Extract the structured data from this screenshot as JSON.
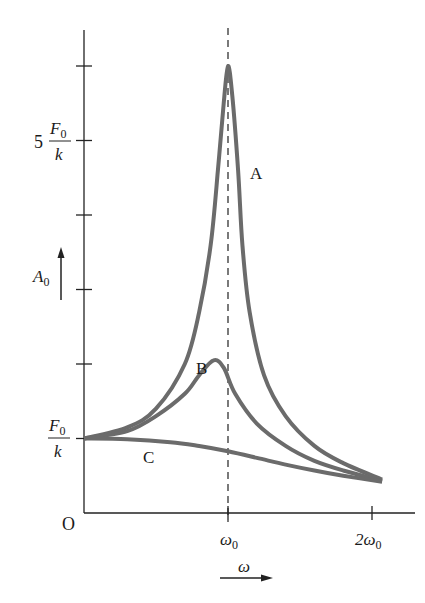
{
  "chart_data": {
    "type": "line",
    "title": "",
    "xlabel": "ω",
    "ylabel": "A0",
    "x_unit": "ω0",
    "y_unit": "F0/k",
    "xlim": [
      0,
      2.25
    ],
    "ylim": [
      0,
      6.4
    ],
    "grid": false,
    "legend": "inline labels",
    "x_ticks": [
      {
        "value": 1,
        "label": "ω0",
        "label_main": "ω",
        "label_sub": "0"
      },
      {
        "value": 2,
        "label": "2ω0",
        "label_main": "2ω",
        "label_sub": "0"
      }
    ],
    "y_ticks": [
      {
        "value": 1,
        "label": "F0/k"
      },
      {
        "value": 2,
        "label": ""
      },
      {
        "value": 3,
        "label": ""
      },
      {
        "value": 4,
        "label": ""
      },
      {
        "value": 5,
        "label": "5 F0/k"
      },
      {
        "value": 6,
        "label": ""
      }
    ],
    "origin_label": "O",
    "reference_line": {
      "x": 1,
      "style": "dashed",
      "label": "ω = ω0"
    },
    "series": [
      {
        "name": "A",
        "x": [
          0,
          0.3,
          0.5,
          0.7,
          0.8,
          0.88,
          0.93,
          0.97,
          1.0,
          1.03,
          1.07,
          1.1,
          1.15,
          1.25,
          1.4,
          1.6,
          1.8,
          2.07
        ],
        "y": [
          1,
          1.15,
          1.4,
          2.0,
          2.7,
          3.6,
          4.6,
          5.5,
          6.0,
          5.6,
          4.6,
          3.6,
          2.7,
          1.85,
          1.3,
          0.9,
          0.67,
          0.45
        ],
        "label_pos": {
          "x": 1.17,
          "y": 4.6
        }
      },
      {
        "name": "B",
        "x": [
          0,
          0.3,
          0.5,
          0.7,
          0.8,
          0.9,
          0.97,
          1.05,
          1.2,
          1.4,
          1.6,
          1.8,
          2.07
        ],
        "y": [
          1,
          1.1,
          1.3,
          1.6,
          1.85,
          2.05,
          1.95,
          1.6,
          1.2,
          0.9,
          0.7,
          0.57,
          0.43
        ],
        "label_pos": {
          "x": 0.8,
          "y": 1.5
        }
      },
      {
        "name": "C",
        "x": [
          0,
          0.3,
          0.6,
          0.8,
          1.0,
          1.2,
          1.4,
          1.6,
          1.8,
          2.07
        ],
        "y": [
          1,
          0.99,
          0.95,
          0.9,
          0.83,
          0.74,
          0.65,
          0.57,
          0.5,
          0.42
        ],
        "label_pos": {
          "x": 0.43,
          "y": 0.72
        }
      }
    ],
    "colors": {
      "curve": "#6b6b6b",
      "axis": "#222222",
      "text": "#1a1a1a"
    }
  },
  "labels": {
    "y_tick_5_coef": "5",
    "frac_num_main": "F",
    "frac_num_sub": "0",
    "frac_den": "k",
    "y_axis_main": "A",
    "y_axis_sub": "0",
    "x_axis": "ω",
    "origin": "O",
    "curve_a": "A",
    "curve_b": "B",
    "curve_c": "C",
    "x_tick_1_main": "ω",
    "x_tick_1_sub": "0",
    "x_tick_2_main": "2ω",
    "x_tick_2_sub": "0"
  }
}
